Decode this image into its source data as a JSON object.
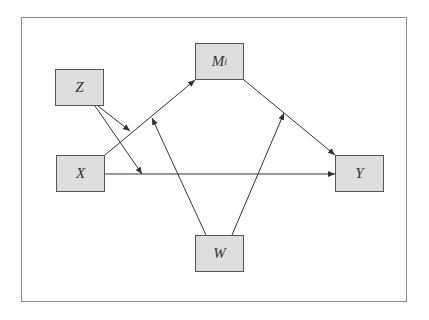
{
  "diagram": {
    "type": "moderated mediation path diagram",
    "nodes": {
      "z": {
        "label": "Z"
      },
      "x": {
        "label": "X"
      },
      "m": {
        "label": "M",
        "subscript": "i"
      },
      "y": {
        "label": "Y"
      },
      "w": {
        "label": "W"
      }
    },
    "edges": [
      {
        "from": "X",
        "to": "M_i"
      },
      {
        "from": "M_i",
        "to": "Y"
      },
      {
        "from": "X",
        "to": "Y"
      },
      {
        "from": "Z",
        "to": "X→M_i path"
      },
      {
        "from": "Z",
        "to": "X→Y path"
      },
      {
        "from": "W",
        "to": "X→M_i path"
      },
      {
        "from": "W",
        "to": "M_i→Y path"
      }
    ],
    "colors": {
      "node_fill": "#dedede",
      "node_border": "#555555",
      "line": "#333333",
      "frame": "#8a8a8a"
    }
  }
}
